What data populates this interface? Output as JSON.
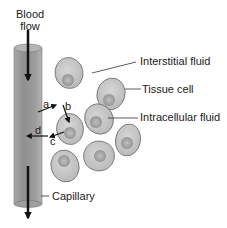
{
  "diagram": {
    "title_label": {
      "line1": "Blood",
      "line2": "flow"
    },
    "labels": {
      "interstitial": "Interstitial fluid",
      "tissue_cell": "Tissue cell",
      "intracellular": "Intracellular fluid",
      "capillary": "Capillary"
    },
    "arrow_letters": {
      "a": "a",
      "b": "b",
      "c": "c",
      "d": "d"
    },
    "colors": {
      "capillary_fill": "#9a9a9a",
      "cell_fill": "#c4c4c4",
      "nucleus_fill": "#a8a8a8",
      "outline": "#6e6e6e",
      "arrow": "#111111"
    }
  }
}
